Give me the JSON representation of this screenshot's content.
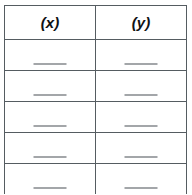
{
  "document": {
    "type": "worksheet-table",
    "title": "Blank (x) and (y) value table"
  },
  "table": {
    "columns": [
      {
        "id": "x",
        "header": "(x)"
      },
      {
        "id": "y",
        "header": "(y)"
      }
    ],
    "rows": [
      {
        "x": "",
        "y": ""
      },
      {
        "x": "",
        "y": ""
      },
      {
        "x": "",
        "y": ""
      },
      {
        "x": "",
        "y": ""
      },
      {
        "x": "",
        "y": ""
      }
    ],
    "row_count": 5,
    "blank_entry_marker": "answer-blank-rule"
  },
  "colors": {
    "page_background": "#ffffff",
    "cell_background": "#ffffff",
    "border": "#555c61",
    "header_text": "#101214",
    "blank_rule": "#a3a6a9"
  },
  "chart_data": {
    "type": "table",
    "title": "",
    "columns": [
      "(x)",
      "(y)"
    ],
    "rows": [
      [
        "",
        ""
      ],
      [
        "",
        ""
      ],
      [
        "",
        ""
      ],
      [
        "",
        ""
      ],
      [
        "",
        ""
      ]
    ],
    "xlabel": "(x)",
    "ylabel": "(y)"
  }
}
